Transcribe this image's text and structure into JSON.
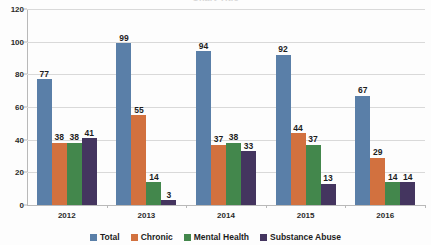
{
  "chart_data": {
    "type": "bar",
    "title": "",
    "xlabel": "",
    "ylabel": "",
    "ylim": [
      0,
      120
    ],
    "yticks": [
      0,
      20,
      40,
      60,
      80,
      100,
      120
    ],
    "grid": true,
    "legend_position": "bottom",
    "categories": [
      "2012",
      "2013",
      "2014",
      "2015",
      "2016"
    ],
    "series": [
      {
        "name": "Total",
        "color": "#5A7FA8",
        "values": [
          77,
          99,
          94,
          92,
          67
        ]
      },
      {
        "name": "Chronic",
        "color": "#D2713F",
        "values": [
          38,
          55,
          37,
          44,
          29
        ]
      },
      {
        "name": "Mental Health",
        "color": "#43874C",
        "values": [
          38,
          14,
          38,
          37,
          14
        ]
      },
      {
        "name": "Substance Abuse",
        "color": "#44355F",
        "values": [
          41,
          3,
          33,
          13,
          14
        ]
      }
    ]
  },
  "title_remnant": "Chart Title"
}
